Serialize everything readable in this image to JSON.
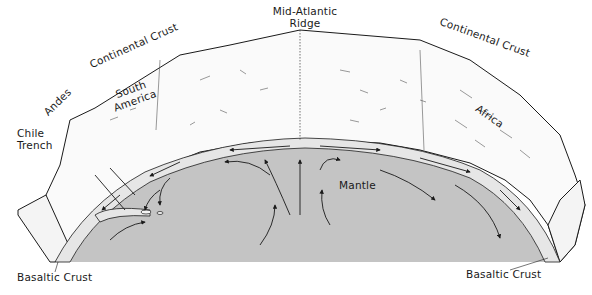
{
  "diagram": {
    "labels": {
      "mid_atlantic_ridge_line1": "Mid-Atlantic",
      "mid_atlantic_ridge_line2": "Ridge",
      "continental_crust_left": "Continental Crust",
      "continental_crust_right": "Continental Crust",
      "andes": "Andes",
      "south_america_line1": "South",
      "south_america_line2": "America",
      "africa": "Africa",
      "chile_trench_line1": "Chile",
      "chile_trench_line2": "Trench",
      "mantle": "Mantle",
      "basaltic_crust_left": "Basaltic Crust",
      "basaltic_crust_right": "Basaltic Crust"
    },
    "colors": {
      "mantle": "#c4c4c4",
      "crust_band": "#e6e6e6",
      "continent": "#fafafa",
      "ink": "#1a1a1a",
      "background": "#ffffff"
    }
  }
}
